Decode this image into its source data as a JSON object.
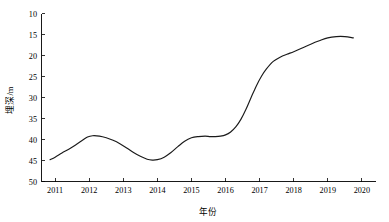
{
  "chart_data": {
    "type": "line",
    "title": "",
    "xlabel": "年份",
    "ylabel": "埋深/m",
    "xlim": [
      2010.6,
      2020.4
    ],
    "ylim": [
      10,
      50
    ],
    "y_inverted": true,
    "grid": false,
    "legend": null,
    "legend_position": "none",
    "line_color": "#1a1a1a",
    "xticks": [
      2011,
      2012,
      2013,
      2014,
      2015,
      2016,
      2017,
      2018,
      2019,
      2020
    ],
    "xtick_labels": [
      "2011",
      "2012",
      "2013",
      "2014",
      "2015",
      "2016",
      "2017",
      "2018",
      "2019",
      "2020"
    ],
    "yticks": [
      10,
      15,
      20,
      25,
      30,
      35,
      40,
      45,
      50
    ],
    "ytick_labels": [
      "10",
      "15",
      "20",
      "25",
      "30",
      "35",
      "40",
      "45",
      "50"
    ],
    "x": [
      2010.85,
      2011.0,
      2011.2,
      2011.4,
      2011.6,
      2011.8,
      2011.95,
      2012.1,
      2012.3,
      2012.5,
      2012.7,
      2012.9,
      2013.1,
      2013.3,
      2013.5,
      2013.7,
      2013.85,
      2014.0,
      2014.2,
      2014.4,
      2014.6,
      2014.8,
      2015.0,
      2015.2,
      2015.4,
      2015.55,
      2015.7,
      2015.85,
      2016.0,
      2016.15,
      2016.3,
      2016.45,
      2016.6,
      2016.75,
      2016.9,
      2017.05,
      2017.2,
      2017.4,
      2017.6,
      2017.8,
      2018.0,
      2018.25,
      2018.5,
      2018.75,
      2019.0,
      2019.25,
      2019.5,
      2019.75
    ],
    "values": [
      44.8,
      44.2,
      43.2,
      42.3,
      41.3,
      40.2,
      39.4,
      39.1,
      39.2,
      39.6,
      40.2,
      41.0,
      42.0,
      43.1,
      44.0,
      44.7,
      44.9,
      44.8,
      44.2,
      43.1,
      41.7,
      40.4,
      39.6,
      39.3,
      39.2,
      39.3,
      39.3,
      39.2,
      38.9,
      38.2,
      37.0,
      35.2,
      32.8,
      30.0,
      27.3,
      25.0,
      23.2,
      21.4,
      20.4,
      19.7,
      19.1,
      18.2,
      17.3,
      16.5,
      15.8,
      15.5,
      15.5,
      15.8
    ],
    "series": [
      {
        "name": "埋深",
        "unit": "m",
        "color": "#1a1a1a",
        "marker": "none"
      }
    ],
    "annotations": []
  },
  "axes": {
    "y_title": "埋深/m",
    "x_title": "年份"
  }
}
